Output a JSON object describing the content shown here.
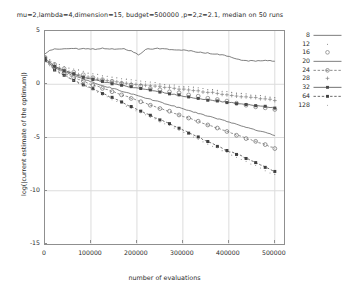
{
  "chart_data": {
    "type": "line",
    "title": "mu=2,lambda=4,dimension=15, budget=500000 ,p=2,z=2.1, median on 50 runs",
    "xlabel": "number of evaluations",
    "ylabel": "log(|current estimate of the optimum|)",
    "xlim": [
      0,
      520000
    ],
    "ylim": [
      -15,
      5
    ],
    "xticks": [
      0,
      100000,
      200000,
      300000,
      400000,
      500000
    ],
    "xticklabels": [
      "0",
      "100000",
      "200000",
      "300000",
      "400000",
      "500000"
    ],
    "yticks": [
      5,
      0,
      -5,
      -10,
      -15
    ],
    "yticklabels": [
      "5",
      "0",
      "-5",
      "-10",
      "-15"
    ],
    "grid": true,
    "legend_position": "right-outside",
    "legend_title": "",
    "series": [
      {
        "name": "8",
        "marker": "none",
        "style": "solid-line",
        "color": "#555555",
        "x": [
          0,
          12000,
          25000,
          40000,
          55000,
          70000,
          90000,
          110000,
          130000,
          150000,
          170000,
          190000,
          205000,
          220000,
          235000,
          245000,
          260000,
          280000,
          300000,
          320000,
          340000,
          360000,
          380000,
          400000,
          420000,
          440000,
          455000,
          470000,
          485000,
          500000
        ],
        "y": [
          2.9,
          3.2,
          3.35,
          3.3,
          3.4,
          3.32,
          3.35,
          3.3,
          3.38,
          3.3,
          3.35,
          3.1,
          2.75,
          3.35,
          3.3,
          3.35,
          3.3,
          3.25,
          3.2,
          3.1,
          3.0,
          2.9,
          2.8,
          2.6,
          2.35,
          2.2,
          2.2,
          2.2,
          2.2,
          2.2
        ]
      },
      {
        "name": "12",
        "marker": "dot",
        "style": "points-small",
        "color": "#6e6e6e",
        "x": [
          0,
          20000,
          40000,
          60000,
          80000,
          100000,
          120000,
          140000,
          160000,
          180000,
          200000,
          220000,
          240000,
          260000,
          280000,
          300000,
          320000,
          340000,
          360000,
          380000,
          400000,
          420000,
          440000,
          460000,
          480000,
          500000
        ],
        "y": [
          2.6,
          2.0,
          1.7,
          1.45,
          1.25,
          1.0,
          0.85,
          0.7,
          0.55,
          0.45,
          0.35,
          0.25,
          0.12,
          0.0,
          -0.1,
          -0.2,
          -0.3,
          -0.4,
          -0.5,
          -0.6,
          -0.72,
          -0.85,
          -0.95,
          -1.05,
          -1.15,
          -1.25
        ]
      },
      {
        "name": "16",
        "marker": "open-circle",
        "style": "points",
        "color": "#777777",
        "x": [
          0,
          20000,
          40000,
          60000,
          80000,
          100000,
          120000,
          140000,
          160000,
          180000,
          200000,
          220000,
          240000,
          260000,
          280000,
          300000,
          320000,
          340000,
          360000,
          380000,
          400000,
          420000,
          440000,
          460000,
          480000,
          500000
        ],
        "y": [
          2.5,
          1.85,
          1.5,
          1.2,
          0.95,
          0.7,
          0.5,
          0.3,
          0.15,
          0.0,
          -0.15,
          -0.3,
          -0.45,
          -0.6,
          -0.75,
          -0.9,
          -1.05,
          -1.2,
          -1.35,
          -1.5,
          -1.65,
          -1.8,
          -1.95,
          -2.1,
          -2.25,
          -2.4
        ]
      },
      {
        "name": "20",
        "marker": "none",
        "style": "solid-line",
        "color": "#5a5a5a",
        "x": [
          0,
          20000,
          40000,
          60000,
          80000,
          100000,
          120000,
          140000,
          160000,
          180000,
          200000,
          220000,
          240000,
          260000,
          280000,
          300000,
          320000,
          340000,
          360000,
          380000,
          400000,
          420000,
          440000,
          460000,
          480000,
          500000
        ],
        "y": [
          2.3,
          1.6,
          1.2,
          0.85,
          0.55,
          0.25,
          -0.05,
          -0.3,
          -0.55,
          -0.8,
          -1.05,
          -1.3,
          -1.55,
          -1.8,
          -2.05,
          -2.3,
          -2.55,
          -2.8,
          -3.05,
          -3.3,
          -3.55,
          -3.8,
          -4.05,
          -4.3,
          -4.55,
          -4.8
        ]
      },
      {
        "name": "24",
        "marker": "circle-dash",
        "style": "points-line",
        "color": "#6a6a6a",
        "x": [
          0,
          20000,
          40000,
          60000,
          80000,
          100000,
          120000,
          140000,
          160000,
          180000,
          200000,
          220000,
          240000,
          260000,
          280000,
          300000,
          320000,
          340000,
          360000,
          380000,
          400000,
          420000,
          440000,
          460000,
          480000,
          500000
        ],
        "y": [
          2.35,
          1.55,
          1.1,
          0.7,
          0.35,
          0.0,
          -0.3,
          -0.6,
          -0.9,
          -1.2,
          -1.5,
          -1.8,
          -2.1,
          -2.4,
          -2.7,
          -3.0,
          -3.3,
          -3.6,
          -3.9,
          -4.2,
          -4.5,
          -4.8,
          -5.1,
          -5.4,
          -5.7,
          -6.0
        ]
      },
      {
        "name": "28",
        "marker": "plus",
        "style": "points-small",
        "color": "#808080",
        "x": [
          0,
          20000,
          40000,
          60000,
          80000,
          100000,
          120000,
          140000,
          160000,
          180000,
          200000,
          220000,
          240000,
          260000,
          280000,
          300000,
          320000,
          340000,
          360000,
          380000,
          400000,
          420000,
          440000,
          460000,
          480000,
          500000
        ],
        "y": [
          2.45,
          1.75,
          1.35,
          1.05,
          0.8,
          0.6,
          0.45,
          0.3,
          0.2,
          0.1,
          0.0,
          -0.08,
          -0.18,
          -0.28,
          -0.38,
          -0.48,
          -0.58,
          -0.68,
          -0.78,
          -0.88,
          -1.0,
          -1.1,
          -1.2,
          -1.3,
          -1.4,
          -1.5
        ]
      },
      {
        "name": "32",
        "marker": "filled-square",
        "style": "points-line",
        "color": "#4a4a4a",
        "x": [
          0,
          20000,
          40000,
          60000,
          80000,
          100000,
          120000,
          140000,
          160000,
          180000,
          200000,
          220000,
          240000,
          260000,
          280000,
          300000,
          320000,
          340000,
          360000,
          380000,
          400000,
          420000,
          440000,
          460000,
          480000,
          500000
        ],
        "y": [
          2.4,
          1.7,
          1.3,
          1.0,
          0.72,
          0.5,
          0.3,
          0.12,
          -0.05,
          -0.2,
          -0.35,
          -0.5,
          -0.65,
          -0.8,
          -0.95,
          -1.1,
          -1.25,
          -1.4,
          -1.5,
          -1.6,
          -1.7,
          -1.8,
          -1.9,
          -2.0,
          -2.1,
          -2.2
        ]
      },
      {
        "name": "64",
        "marker": "filled-square-dash",
        "style": "points-line",
        "color": "#3f3f3f",
        "x": [
          0,
          20000,
          40000,
          60000,
          80000,
          100000,
          120000,
          140000,
          160000,
          180000,
          200000,
          220000,
          240000,
          260000,
          280000,
          300000,
          320000,
          340000,
          360000,
          380000,
          400000,
          420000,
          440000,
          460000,
          480000,
          500000
        ],
        "y": [
          2.2,
          1.4,
          0.9,
          0.45,
          0.05,
          -0.35,
          -0.75,
          -1.15,
          -1.55,
          -1.95,
          -2.35,
          -2.75,
          -3.15,
          -3.5,
          -3.9,
          -4.3,
          -4.7,
          -5.1,
          -5.5,
          -5.9,
          -6.3,
          -6.6,
          -7.0,
          -7.4,
          -7.8,
          -8.2
        ]
      },
      {
        "name": "128",
        "marker": "small-dot",
        "style": "points-sparse",
        "color": "#909090",
        "x": [
          0,
          20000,
          40000,
          60000,
          80000,
          100000,
          120000,
          140000,
          160000,
          180000,
          200000,
          220000,
          240000,
          260000,
          280000,
          300000,
          320000,
          340000,
          360000,
          380000,
          400000,
          420000,
          440000,
          460000,
          480000,
          500000
        ],
        "y": [
          2.15,
          1.35,
          0.85,
          0.4,
          -0.05,
          -0.45,
          -0.9,
          -1.3,
          -1.7,
          -2.1,
          -2.5,
          -2.9,
          -3.3,
          -3.7,
          -4.1,
          -4.5,
          -4.9,
          -5.3,
          -5.7,
          -6.1,
          -6.5,
          -6.9,
          -7.3,
          -7.7,
          -8.1,
          -8.5
        ]
      }
    ]
  }
}
